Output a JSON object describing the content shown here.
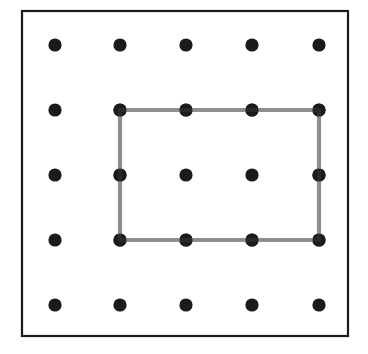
{
  "figure": {
    "canvas": {
      "width": 368,
      "height": 354,
      "background": "#ffffff"
    },
    "board": {
      "label": "geoboard-frame",
      "x": 22,
      "y": 11,
      "width": 326,
      "height": 325,
      "stroke": "#1a1a1a",
      "stroke_width": 2.2,
      "fill": "#ffffff"
    },
    "pegs": {
      "label": "peg-grid",
      "rows": 5,
      "columns": 5,
      "radius": 6.6,
      "color": "#1b1b1b",
      "column_x": [
        55,
        120,
        186,
        252,
        319
      ],
      "row_y": [
        45,
        110,
        175,
        240,
        305
      ],
      "points": [
        {
          "id": "peg-r1c1",
          "x": 55,
          "y": 45
        },
        {
          "id": "peg-r1c2",
          "x": 120,
          "y": 45
        },
        {
          "id": "peg-r1c3",
          "x": 186,
          "y": 45
        },
        {
          "id": "peg-r1c4",
          "x": 252,
          "y": 45
        },
        {
          "id": "peg-r1c5",
          "x": 319,
          "y": 45
        },
        {
          "id": "peg-r2c1",
          "x": 55,
          "y": 110
        },
        {
          "id": "peg-r2c2",
          "x": 120,
          "y": 110
        },
        {
          "id": "peg-r2c3",
          "x": 186,
          "y": 110
        },
        {
          "id": "peg-r2c4",
          "x": 252,
          "y": 110
        },
        {
          "id": "peg-r2c5",
          "x": 319,
          "y": 110
        },
        {
          "id": "peg-r3c1",
          "x": 55,
          "y": 175
        },
        {
          "id": "peg-r3c2",
          "x": 120,
          "y": 175
        },
        {
          "id": "peg-r3c3",
          "x": 186,
          "y": 175
        },
        {
          "id": "peg-r3c4",
          "x": 252,
          "y": 175
        },
        {
          "id": "peg-r3c5",
          "x": 319,
          "y": 175
        },
        {
          "id": "peg-r4c1",
          "x": 55,
          "y": 240
        },
        {
          "id": "peg-r4c2",
          "x": 120,
          "y": 240
        },
        {
          "id": "peg-r4c3",
          "x": 186,
          "y": 240
        },
        {
          "id": "peg-r4c4",
          "x": 252,
          "y": 240
        },
        {
          "id": "peg-r4c5",
          "x": 319,
          "y": 240
        },
        {
          "id": "peg-r5c1",
          "x": 55,
          "y": 305
        },
        {
          "id": "peg-r5c2",
          "x": 120,
          "y": 305
        },
        {
          "id": "peg-r5c3",
          "x": 186,
          "y": 305
        },
        {
          "id": "peg-r5c4",
          "x": 252,
          "y": 305
        },
        {
          "id": "peg-r5c5",
          "x": 319,
          "y": 305
        }
      ]
    },
    "band": {
      "label": "rubber-band-rectangle",
      "stroke": "#8f8f8f",
      "stroke_width": 4.2,
      "fill": "none",
      "vertices": [
        {
          "id": "band-corner-top-left",
          "x": 120,
          "y": 110
        },
        {
          "id": "band-corner-top-right",
          "x": 319,
          "y": 110
        },
        {
          "id": "band-corner-bottom-right",
          "x": 319,
          "y": 240
        },
        {
          "id": "band-corner-bottom-left",
          "x": 120,
          "y": 240
        }
      ],
      "points_string": "120,110 319,110 319,240 120,240",
      "spans": {
        "width_units": 3,
        "height_units": 2
      }
    }
  }
}
